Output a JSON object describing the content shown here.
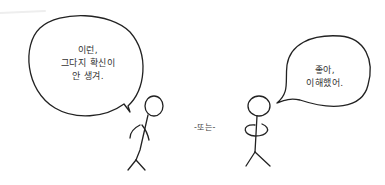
{
  "comic": {
    "left_speech": {
      "lines": [
        "이런,",
        "그다지 확신이",
        "안 생겨."
      ]
    },
    "right_speech": {
      "lines": [
        "좋아,",
        "이해했어."
      ]
    },
    "separator": "-또는-"
  },
  "colors": {
    "background": "#ffffff",
    "ink": "#222222"
  }
}
